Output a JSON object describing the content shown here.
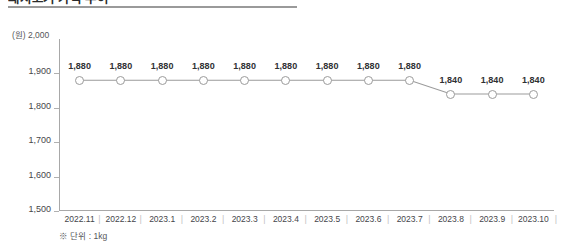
{
  "header": {
    "title": "돼지고기 가격 추이",
    "rule_color": "#9a9a9a"
  },
  "axis": {
    "unit_caption": "(원) 2,000",
    "y_unit": "(원)",
    "footnote": "※ 단위 : 1kg"
  },
  "chart_data": {
    "type": "line",
    "title": "돼지고기 가격 추이",
    "xlabel": "",
    "ylabel": "(원)",
    "ylim": [
      1500,
      2000
    ],
    "yticks": [
      1900,
      1800,
      1700,
      1600,
      1500
    ],
    "ytick_labels": [
      "1,900",
      "1,800",
      "1,700",
      "1,600",
      "1,500"
    ],
    "grid": false,
    "legend": "none",
    "categories": [
      "2022.11",
      "2022.12",
      "2023.1",
      "2023.2",
      "2023.3",
      "2023.4",
      "2023.5",
      "2023.6",
      "2023.7",
      "2023.8",
      "2023.9",
      "2023.10"
    ],
    "values": [
      1880,
      1880,
      1880,
      1880,
      1880,
      1880,
      1880,
      1880,
      1880,
      1840,
      1840,
      1840
    ],
    "point_labels": [
      "1,880",
      "1,880",
      "1,880",
      "1,880",
      "1,880",
      "1,880",
      "1,880",
      "1,880",
      "1,880",
      "1,840",
      "1,840",
      "1,840"
    ],
    "line_color": "#9b9b9b",
    "marker_fill": "#ffffff",
    "marker_stroke": "#9b9b9b",
    "annotation": "※ 단위 : 1kg"
  }
}
